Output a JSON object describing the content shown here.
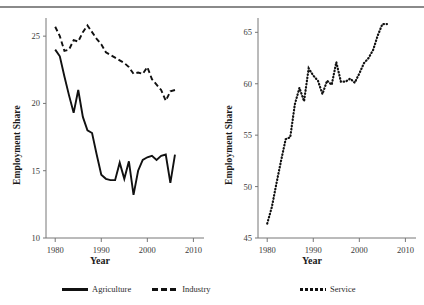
{
  "figure": {
    "top_rule": true,
    "panels": [
      "left",
      "right"
    ]
  },
  "legend": {
    "left_entries": [
      {
        "label": "Agriculture",
        "style": "solid",
        "color": "#111111"
      },
      {
        "label": "Industry",
        "style": "dashed",
        "color": "#111111"
      }
    ],
    "right_entries": [
      {
        "label": "Service",
        "style": "dotted",
        "color": "#111111"
      }
    ]
  },
  "chart_data": [
    {
      "id": "left-panel",
      "type": "line",
      "title": "",
      "xlabel": "Year",
      "ylabel": "Employment Share",
      "xlim": [
        1978,
        2011
      ],
      "ylim": [
        10,
        26.2
      ],
      "xticks": [
        1980,
        1990,
        2000,
        2010
      ],
      "yticks": [
        10,
        15,
        20,
        25
      ],
      "grid": false,
      "legend_position": "below",
      "x": [
        1980,
        1981,
        1982,
        1983,
        1984,
        1985,
        1986,
        1987,
        1988,
        1989,
        1990,
        1991,
        1992,
        1993,
        1994,
        1995,
        1996,
        1997,
        1998,
        1999,
        2000,
        2001,
        2002,
        2003,
        2004,
        2005,
        2006
      ],
      "series": [
        {
          "name": "Agriculture",
          "style": "solid",
          "color": "#111111",
          "values": [
            24.0,
            23.5,
            22.0,
            20.6,
            19.3,
            21.0,
            19.0,
            18.0,
            17.8,
            16.2,
            14.7,
            14.4,
            14.3,
            14.3,
            15.6,
            14.4,
            15.7,
            13.2,
            15.0,
            15.8,
            16.0,
            16.1,
            15.8,
            16.1,
            16.2,
            14.1,
            16.2
          ]
        },
        {
          "name": "Industry",
          "style": "dashed",
          "color": "#111111",
          "values": [
            25.7,
            25.0,
            23.9,
            24.0,
            24.7,
            24.6,
            25.3,
            25.8,
            25.3,
            24.8,
            24.4,
            23.8,
            23.6,
            23.4,
            23.2,
            23.0,
            22.7,
            22.2,
            22.3,
            22.2,
            22.7,
            21.8,
            21.4,
            21.0,
            20.2,
            20.9,
            21.0
          ]
        }
      ],
      "agriculture_last_values": [
        15.0,
        14.4,
        13.3
      ]
    },
    {
      "id": "right-panel",
      "type": "line",
      "title": "",
      "xlabel": "Year",
      "ylabel": "Employment Share",
      "xlim": [
        1978,
        2011
      ],
      "ylim": [
        45,
        66.2
      ],
      "xticks": [
        1980,
        1990,
        2000,
        2010
      ],
      "yticks": [
        45,
        50,
        55,
        60,
        65
      ],
      "grid": false,
      "legend_position": "below",
      "x": [
        1980,
        1981,
        1982,
        1983,
        1984,
        1985,
        1986,
        1987,
        1988,
        1989,
        1990,
        1991,
        1992,
        1993,
        1994,
        1995,
        1996,
        1997,
        1998,
        1999,
        2000,
        2001,
        2002,
        2003,
        2004,
        2005,
        2006
      ],
      "series": [
        {
          "name": "Service",
          "style": "dotted",
          "color": "#111111",
          "values": [
            46.4,
            48.0,
            50.3,
            52.5,
            54.6,
            54.8,
            58.0,
            59.6,
            58.3,
            61.5,
            60.8,
            60.3,
            59.0,
            60.3,
            59.9,
            62.1,
            60.2,
            60.2,
            60.5,
            60.1,
            61.0,
            62.0,
            62.5,
            63.3,
            64.7,
            65.8,
            65.8
          ]
        }
      ]
    }
  ]
}
